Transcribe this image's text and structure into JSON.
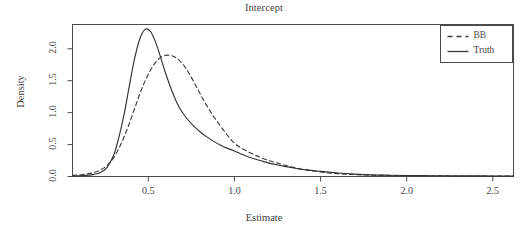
{
  "chart_data": {
    "type": "line",
    "title": "Intercept",
    "xlabel": "Estimate",
    "ylabel": "Density",
    "xlim": [
      0.06,
      2.62
    ],
    "ylim": [
      0.0,
      2.38
    ],
    "grid": false,
    "legend_position": "top-right",
    "xticks": [
      0.5,
      1.0,
      1.5,
      2.0,
      2.5
    ],
    "xtick_labels": [
      "0.5",
      "1.0",
      "1.5",
      "2.0",
      "2.5"
    ],
    "yticks": [
      0.0,
      0.5,
      1.0,
      1.5,
      2.0
    ],
    "ytick_labels": [
      "0.0",
      "0.5",
      "1.0",
      "1.5",
      "2.0"
    ],
    "series": [
      {
        "name": "BB",
        "style": "dashed",
        "color": "#3a3a3a",
        "peak_x": 0.6,
        "peak_y": 1.9,
        "x": [
          0.06,
          0.12,
          0.18,
          0.22,
          0.26,
          0.3,
          0.34,
          0.38,
          0.42,
          0.46,
          0.5,
          0.54,
          0.58,
          0.62,
          0.66,
          0.7,
          0.74,
          0.78,
          0.82,
          0.86,
          0.9,
          0.95,
          1.0,
          1.05,
          1.1,
          1.15,
          1.2,
          1.25,
          1.3,
          1.35,
          1.4,
          1.45,
          1.5,
          1.55,
          1.6,
          1.7,
          1.8,
          1.9,
          2.0,
          2.1,
          2.2,
          2.3,
          2.4,
          2.5,
          2.62
        ],
        "y": [
          0.02,
          0.03,
          0.06,
          0.1,
          0.17,
          0.3,
          0.5,
          0.76,
          1.06,
          1.36,
          1.6,
          1.78,
          1.88,
          1.9,
          1.86,
          1.76,
          1.6,
          1.4,
          1.2,
          1.02,
          0.86,
          0.68,
          0.52,
          0.43,
          0.36,
          0.3,
          0.25,
          0.21,
          0.17,
          0.14,
          0.11,
          0.09,
          0.07,
          0.055,
          0.045,
          0.03,
          0.02,
          0.015,
          0.012,
          0.01,
          0.009,
          0.008,
          0.007,
          0.006,
          0.005
        ]
      },
      {
        "name": "Truth",
        "style": "solid",
        "color": "#333333",
        "peak_x": 0.49,
        "peak_y": 2.3,
        "x": [
          0.06,
          0.12,
          0.18,
          0.22,
          0.26,
          0.3,
          0.33,
          0.36,
          0.39,
          0.42,
          0.45,
          0.48,
          0.51,
          0.54,
          0.57,
          0.6,
          0.64,
          0.68,
          0.72,
          0.76,
          0.8,
          0.84,
          0.88,
          0.92,
          0.96,
          1.0,
          1.05,
          1.1,
          1.15,
          1.2,
          1.25,
          1.3,
          1.35,
          1.4,
          1.45,
          1.5,
          1.6,
          1.7,
          1.8,
          1.9,
          2.0,
          2.1,
          2.2,
          2.3,
          2.4,
          2.5,
          2.62
        ],
        "y": [
          0.01,
          0.015,
          0.03,
          0.06,
          0.14,
          0.34,
          0.62,
          0.98,
          1.42,
          1.84,
          2.15,
          2.3,
          2.28,
          2.12,
          1.88,
          1.62,
          1.32,
          1.08,
          0.92,
          0.8,
          0.7,
          0.62,
          0.55,
          0.49,
          0.44,
          0.4,
          0.34,
          0.29,
          0.25,
          0.21,
          0.18,
          0.155,
          0.13,
          0.11,
          0.095,
          0.08,
          0.055,
          0.038,
          0.026,
          0.02,
          0.016,
          0.013,
          0.011,
          0.01,
          0.009,
          0.008,
          0.007
        ]
      }
    ],
    "legend": [
      {
        "label": "BB",
        "style": "dashed"
      },
      {
        "label": "Truth",
        "style": "solid"
      }
    ]
  }
}
